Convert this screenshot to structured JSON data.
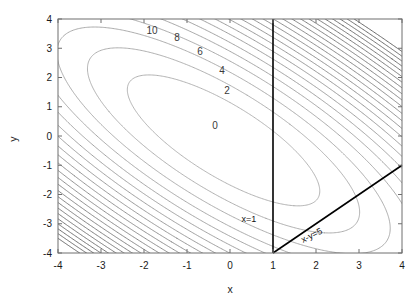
{
  "chart_data": {
    "type": "line",
    "subtype": "contour",
    "title": "",
    "xlabel": "x",
    "ylabel": "y",
    "xlim": [
      -4,
      4
    ],
    "ylim": [
      -4,
      4
    ],
    "xticks": [
      "-4",
      "-3",
      "-2",
      "-1",
      "0",
      "1",
      "2",
      "3",
      "4"
    ],
    "yticks": [
      "-4",
      "-3",
      "-2",
      "-1",
      "0",
      "1",
      "2",
      "3",
      "4"
    ],
    "xtick_values": [
      -4,
      -3,
      -2,
      -1,
      0,
      1,
      2,
      3,
      4
    ],
    "ytick_values": [
      -4,
      -3,
      -2,
      -1,
      0,
      1,
      2,
      3,
      4
    ],
    "grid": false,
    "legend": "none",
    "contour_levels": [
      0,
      2,
      4,
      6,
      8,
      10,
      12,
      14,
      16,
      18,
      20,
      22,
      24,
      26,
      28,
      30,
      32,
      34,
      36,
      38,
      40,
      42,
      44,
      46
    ],
    "labeled_levels": [
      {
        "level": "0",
        "x": 215,
        "y": 129
      },
      {
        "level": "2",
        "x": 227,
        "y": 94
      },
      {
        "level": "4",
        "x": 222,
        "y": 74
      },
      {
        "level": "6",
        "x": 200,
        "y": 55
      },
      {
        "level": "8",
        "x": 177,
        "y": 41
      },
      {
        "level": "10",
        "x": 152,
        "y": 34
      }
    ],
    "contour_center": [
      -0.15,
      -0.15
    ],
    "contour_function": "quadratic bowl, level = a(x-cx)^2 + b(y-cy)^2 + c(x-cx)(y-cy), rotated ellipses with positive xy cross term",
    "ellipse_rotation_deg": -45,
    "constraints": [
      {
        "name": "x=1",
        "label": "x=1",
        "type": "vertical",
        "value": 1,
        "label_x": 249,
        "label_y": 222,
        "color": "#000000",
        "width": 1.6
      },
      {
        "name": "x-y=5",
        "label": "x-y=5",
        "type": "line",
        "slope": 1,
        "intercept": -5,
        "label_x": 313,
        "label_y": 238,
        "color": "#000000",
        "width": 1.6
      }
    ],
    "contour_color_outer": "#4d4d4d",
    "contour_color_inner": "#a8a8a8",
    "axis_color": "#6e6e6e",
    "background": "#ffffff"
  },
  "plot_box": {
    "left": 58,
    "top": 19,
    "right": 402,
    "bottom": 253
  },
  "axes": {
    "x_axis_title": "x",
    "y_axis_title": "y"
  }
}
